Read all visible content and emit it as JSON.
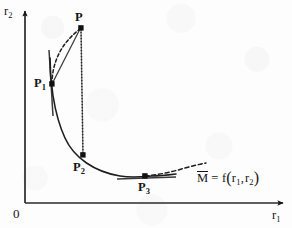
{
  "figure": {
    "background_color": "#fdfdfd",
    "ink_color": "#161616"
  },
  "axes": {
    "x_label": "r",
    "x_label_sub": "1",
    "y_label": "r",
    "y_label_sub": "2",
    "origin_label": "0",
    "x_axis": {
      "x1": 25,
      "y1": 203,
      "x2": 285,
      "y2": 203
    },
    "y_axis": {
      "x1": 25,
      "y1": 203,
      "x2": 25,
      "y2": 9
    }
  },
  "points": [
    {
      "id": "P",
      "label": "P",
      "sub": "",
      "x": 81,
      "y": 28,
      "label_x": 75,
      "label_y": 11
    },
    {
      "id": "P1",
      "label": "P",
      "sub": "1",
      "x": 52,
      "y": 84,
      "label_x": 34,
      "label_y": 77
    },
    {
      "id": "P2",
      "label": "P",
      "sub": "2",
      "x": 83,
      "y": 155,
      "label_x": 73,
      "label_y": 161
    },
    {
      "id": "P3",
      "label": "P",
      "sub": "3",
      "x": 145,
      "y": 176,
      "label_x": 138,
      "label_y": 181
    }
  ],
  "annotation": {
    "equation_m": "M",
    "equation_eq": "= f",
    "equation_open": "(",
    "equation_r1": "r",
    "equation_r1_sub": "1",
    "equation_comma": ",",
    "equation_r2": "r",
    "equation_r2_sub": "2",
    "equation_close": ")",
    "x": 197,
    "y": 169
  },
  "curves": {
    "main_solid_curve": {
      "description": "Solid convex objective curve descending from P1 through P2 to minimum near P3",
      "path": "M 50,58 C 50,78 53,112 65,138 C 74,158 95,172 120,176 C 132,178 140,177 152,176 C 160,176 168,175 176,174"
    },
    "dashed_tail": {
      "description": "Dashed continuation of the curve rising to the right of P3",
      "path": "M 145,176 C 158,175 172,172 185,168 C 193,166 200,164 206,163"
    },
    "dashed_arc_p1_to_p": {
      "description": "Dashed arc from P1 curving up to P",
      "path": "M 52,84 C 52,64 60,44 80,29"
    },
    "solid_chord_p1_to_p": {
      "description": "Solid straight chord from P1 to P",
      "path": "M 52,84 L 80,29"
    },
    "dotted_drop_p_to_p2": {
      "description": "Dotted vertical projection line from P down to P2",
      "path": "M 81,29 L 83,155"
    },
    "tangent_at_p1": {
      "description": "Short steep tangent segment through P1",
      "path": "M 49,50 L 53,116"
    },
    "tangent_at_p3": {
      "description": "Short horizontal tangent segment through P3",
      "path": "M 117,179 L 176,177"
    }
  }
}
